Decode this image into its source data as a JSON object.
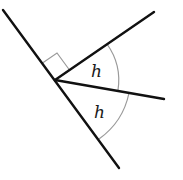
{
  "diagram": {
    "type": "geometry-angles",
    "colors": {
      "line": "#111111",
      "arc": "#9a9a9a",
      "right_angle_marker": "#9a9a9a",
      "label": "#1a1a1a"
    },
    "vertex": [
      55,
      80
    ],
    "lines": [
      {
        "name": "straight-line",
        "from": [
          3,
          10
        ],
        "to": [
          119,
          168
        ]
      },
      {
        "name": "upper-ray",
        "from": [
          55,
          80
        ],
        "to": [
          154,
          12
        ]
      },
      {
        "name": "middle-ray",
        "from": [
          55,
          80
        ],
        "to": [
          164,
          99
        ]
      }
    ],
    "right_angle_marker": true,
    "angles": [
      {
        "label": "h",
        "between": [
          "upper-ray",
          "middle-ray"
        ]
      },
      {
        "label": "h",
        "between": [
          "middle-ray",
          "straight-line"
        ]
      }
    ],
    "labels": {
      "angle_upper": "h",
      "angle_lower": "h"
    }
  }
}
